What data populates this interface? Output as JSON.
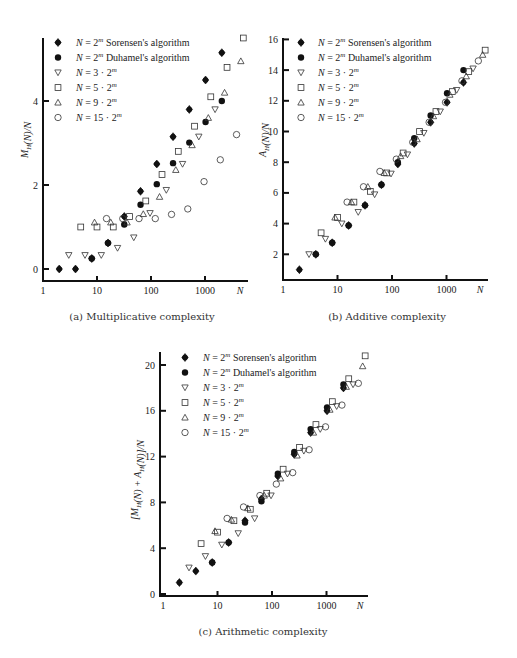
{
  "legend": {
    "entries": [
      {
        "marker": "filled-diamond",
        "label_math": "N = 2",
        "sup": "m",
        "suffix": " Sorensen's algorithm"
      },
      {
        "marker": "filled-circle",
        "label_math": "N = 2",
        "sup": "m",
        "suffix": " Duhamel's algorithm"
      },
      {
        "marker": "down-triangle",
        "label_math": "N = 3 · 2",
        "sup": "m",
        "suffix": ""
      },
      {
        "marker": "square",
        "label_math": "N = 5 · 2",
        "sup": "m",
        "suffix": ""
      },
      {
        "marker": "up-triangle",
        "label_math": "N = 9 · 2",
        "sup": "m",
        "suffix": ""
      },
      {
        "marker": "circle",
        "label_math": "N = 15 · 2",
        "sup": "m",
        "suffix": ""
      }
    ]
  },
  "chart_data": [
    {
      "id": "a",
      "type": "scatter",
      "caption": "(a) Multiplicative complexity",
      "ylabel": "M_H(N)/N",
      "xlabel": "N",
      "xscale": "log",
      "xticks": [
        "1",
        "10",
        "100",
        "1000"
      ],
      "yticks": [
        "0",
        "2",
        "4"
      ],
      "xlim": [
        1,
        5000
      ],
      "ylim": [
        -0.3,
        5.8
      ],
      "grid": false,
      "legend_position": "upper-left",
      "frame": {
        "x0": 43,
        "xdec": 54,
        "y0": 269,
        "yunit": 42,
        "axisX": 281,
        "axisY": 43,
        "xend": 248,
        "ytop": 38
      },
      "series": [
        {
          "name": "N = 2^m Sorensen's algorithm",
          "marker": "filled-diamond",
          "x": [
            2,
            4,
            8,
            16,
            32,
            64,
            128,
            256,
            512,
            1024,
            2048
          ],
          "y": [
            0,
            0,
            0.25,
            0.62,
            1.25,
            1.85,
            2.5,
            3.15,
            3.8,
            4.5,
            5.15
          ]
        },
        {
          "name": "N = 2^m Duhamel's algorithm",
          "marker": "filled-circle",
          "x": [
            8,
            16,
            32,
            64,
            128,
            256,
            512,
            1024,
            2048
          ],
          "y": [
            0.25,
            0.62,
            1.06,
            1.53,
            2.02,
            2.52,
            3.01,
            3.5,
            4.0
          ]
        },
        {
          "name": "N = 3·2^m",
          "marker": "down-triangle",
          "x": [
            3,
            6,
            12,
            24,
            48,
            96,
            192,
            384,
            768,
            1536
          ],
          "y": [
            0.33,
            0.33,
            0.33,
            0.5,
            0.75,
            1.33,
            1.88,
            2.5,
            3.15,
            3.8
          ]
        },
        {
          "name": "N = 5·2^m",
          "marker": "square",
          "x": [
            5,
            10,
            20,
            40,
            80,
            160,
            320,
            640,
            1280,
            2560,
            5120
          ],
          "y": [
            1.0,
            1.0,
            1.0,
            1.25,
            1.62,
            2.25,
            2.8,
            3.4,
            4.1,
            4.8,
            5.5
          ]
        },
        {
          "name": "N = 9·2^m",
          "marker": "up-triangle",
          "x": [
            9,
            18,
            36,
            72,
            144,
            288,
            576,
            1152,
            2304,
            4608
          ],
          "y": [
            1.11,
            1.11,
            1.11,
            1.31,
            1.72,
            2.36,
            2.95,
            3.6,
            4.2,
            4.95
          ]
        },
        {
          "name": "N = 15·2^m",
          "marker": "circle",
          "x": [
            15,
            30,
            60,
            120,
            240,
            480,
            960,
            1920,
            3840
          ],
          "y": [
            1.2,
            1.2,
            1.2,
            1.2,
            1.3,
            1.43,
            2.08,
            2.6,
            3.2
          ]
        }
      ]
    },
    {
      "id": "b",
      "type": "scatter",
      "caption": "(b) Additive complexity",
      "ylabel": "A_H(N)/N",
      "xlabel": "N",
      "xscale": "log",
      "xticks": [
        "1",
        "10",
        "100",
        "1000"
      ],
      "yticks": [
        "2",
        "4",
        "6",
        "8",
        "10",
        "12",
        "14",
        "16"
      ],
      "xlim": [
        1,
        5000
      ],
      "ylim": [
        0.4,
        16.2
      ],
      "grid": false,
      "legend_position": "upper-left",
      "frame": {
        "x0": 283,
        "xdec": 54.5,
        "y0": 285,
        "yunit": 15.35,
        "axisX": 280,
        "axisY": 283,
        "xend": 488,
        "ytop": 38
      },
      "series": [
        {
          "name": "N = 2^m Sorensen's algorithm",
          "marker": "filled-diamond",
          "x": [
            2,
            4,
            8,
            16,
            32,
            64,
            128,
            256,
            512,
            1024,
            2048
          ],
          "y": [
            1.0,
            2.0,
            2.75,
            3.88,
            5.19,
            6.53,
            7.88,
            9.22,
            10.6,
            11.9,
            13.2
          ]
        },
        {
          "name": "N = 2^m Duhamel's algorithm",
          "marker": "filled-circle",
          "x": [
            4,
            8,
            16,
            32,
            64,
            128,
            256,
            512,
            1024,
            2048
          ],
          "y": [
            2.0,
            2.75,
            3.88,
            5.19,
            6.53,
            8.0,
            9.56,
            11.05,
            12.5,
            14.0
          ]
        },
        {
          "name": "N = 3·2^m",
          "marker": "down-triangle",
          "x": [
            3,
            6,
            12,
            24,
            48,
            96,
            192,
            384,
            768,
            1536,
            3072
          ],
          "y": [
            2.0,
            3.0,
            4.0,
            4.75,
            5.9,
            7.25,
            8.5,
            9.9,
            11.3,
            12.7,
            14.1
          ]
        },
        {
          "name": "N = 5·2^m",
          "marker": "square",
          "x": [
            5,
            10,
            20,
            40,
            80,
            160,
            320,
            640,
            1280,
            2560,
            5120
          ],
          "y": [
            3.4,
            4.4,
            5.4,
            6.1,
            7.3,
            8.6,
            10.0,
            11.3,
            12.6,
            13.9,
            15.3
          ]
        },
        {
          "name": "N = 9·2^m",
          "marker": "up-triangle",
          "x": [
            9,
            18,
            36,
            72,
            144,
            288,
            576,
            1152,
            2304,
            4608
          ],
          "y": [
            4.4,
            5.4,
            6.4,
            7.3,
            8.4,
            9.5,
            11.0,
            12.4,
            13.6,
            15.0
          ]
        },
        {
          "name": "N = 15·2^m",
          "marker": "circle",
          "x": [
            15,
            30,
            60,
            120,
            240,
            480,
            960,
            1920,
            3840
          ],
          "y": [
            5.4,
            6.4,
            7.4,
            8.2,
            9.3,
            10.6,
            11.9,
            13.3,
            14.6
          ]
        }
      ]
    },
    {
      "id": "c",
      "type": "scatter",
      "caption": "(c) Arithmetic complexity",
      "ylabel": "[M_H(N) + A_H(N)]/N",
      "xlabel": "N",
      "xscale": "log",
      "xticks": [
        "1",
        "10",
        "100",
        "1000"
      ],
      "yticks": [
        "0",
        "4",
        "8",
        "12",
        "16",
        "20"
      ],
      "xlim": [
        1,
        5000
      ],
      "ylim": [
        -0.2,
        21.5
      ],
      "grid": false,
      "legend_position": "upper-left",
      "frame": {
        "x0": 163,
        "xdec": 54.5,
        "y0": 594,
        "yunit": 11.45,
        "axisX": 596,
        "axisY": 160,
        "xend": 368,
        "ytop": 352
      },
      "series": [
        {
          "name": "N = 2^m Sorensen's algorithm",
          "marker": "filled-diamond",
          "x": [
            2,
            4,
            8,
            16,
            32,
            64,
            128,
            256,
            512,
            1024,
            2048
          ],
          "y": [
            1.0,
            2.0,
            2.75,
            4.5,
            6.4,
            8.3,
            10.3,
            12.2,
            14.1,
            16.0,
            18.0
          ]
        },
        {
          "name": "N = 2^m Duhamel's algorithm",
          "marker": "filled-circle",
          "x": [
            8,
            16,
            32,
            64,
            128,
            256,
            512,
            1024,
            2048
          ],
          "y": [
            2.75,
            4.5,
            6.25,
            8.1,
            10.5,
            12.4,
            14.4,
            16.3,
            18.3
          ]
        },
        {
          "name": "N = 3·2^m",
          "marker": "down-triangle",
          "x": [
            3,
            6,
            12,
            24,
            48,
            96,
            192,
            384,
            768,
            1536,
            3072
          ],
          "y": [
            2.3,
            3.3,
            4.3,
            5.3,
            6.6,
            8.6,
            10.5,
            12.5,
            14.4,
            16.4,
            18.3
          ]
        },
        {
          "name": "N = 5·2^m",
          "marker": "square",
          "x": [
            5,
            10,
            20,
            40,
            80,
            160,
            320,
            640,
            1280,
            2560,
            5120
          ],
          "y": [
            4.4,
            5.4,
            6.4,
            7.4,
            8.8,
            10.9,
            12.8,
            14.8,
            16.8,
            18.8,
            20.8
          ]
        },
        {
          "name": "N = 9·2^m",
          "marker": "up-triangle",
          "x": [
            9,
            18,
            36,
            72,
            144,
            288,
            576,
            1152,
            2304,
            4608
          ],
          "y": [
            5.5,
            6.5,
            7.5,
            8.6,
            10.1,
            12.1,
            14.1,
            16.1,
            18.1,
            19.9
          ]
        },
        {
          "name": "N = 15·2^m",
          "marker": "circle",
          "x": [
            15,
            30,
            60,
            120,
            240,
            480,
            960,
            1920,
            3840
          ],
          "y": [
            6.6,
            7.6,
            8.6,
            9.6,
            10.6,
            12.6,
            14.6,
            16.5,
            18.4
          ]
        }
      ]
    }
  ]
}
